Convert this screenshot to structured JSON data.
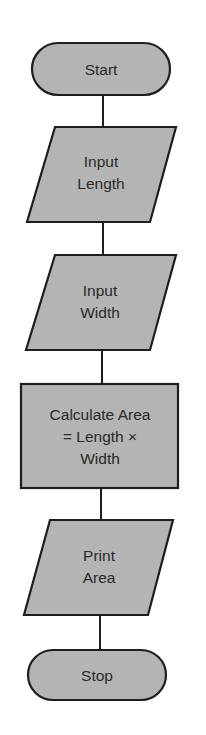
{
  "diagram": {
    "type": "flowchart",
    "colors": {
      "fill": "#b4b4b4",
      "stroke": "#1e1e1e",
      "text": "#2a2a2a",
      "background": "#ffffff"
    },
    "nodes": [
      {
        "id": "start",
        "shape": "terminator",
        "lines": [
          "Start"
        ]
      },
      {
        "id": "input_length",
        "shape": "io",
        "lines": [
          "Input",
          "Length"
        ]
      },
      {
        "id": "input_width",
        "shape": "io",
        "lines": [
          "Input",
          "Width"
        ]
      },
      {
        "id": "calculate",
        "shape": "process",
        "lines": [
          "Calculate Area",
          "= Length ×",
          "Width"
        ]
      },
      {
        "id": "print_area",
        "shape": "io",
        "lines": [
          "Print",
          "Area"
        ]
      },
      {
        "id": "stop",
        "shape": "terminator",
        "lines": [
          "Stop"
        ]
      }
    ],
    "edges": [
      [
        "start",
        "input_length"
      ],
      [
        "input_length",
        "input_width"
      ],
      [
        "input_width",
        "calculate"
      ],
      [
        "calculate",
        "print_area"
      ],
      [
        "print_area",
        "stop"
      ]
    ]
  }
}
